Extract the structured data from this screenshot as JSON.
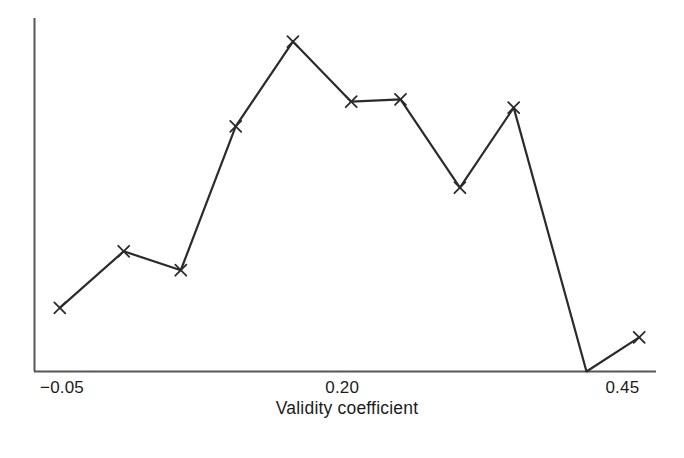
{
  "chart_data": {
    "type": "line",
    "title": "",
    "subtitle": "",
    "xlabel": "Validity coefficient",
    "ylabel": "",
    "grid": false,
    "legend": null,
    "marker": "x",
    "line_color": "#2b2b2b",
    "axis_color": "#555555",
    "background": "#ffffff",
    "xlim": [
      -0.075,
      0.48
    ],
    "ylim": [
      0,
      300
    ],
    "xticks": [
      {
        "value": -0.05,
        "label": "−0.05"
      },
      {
        "value": 0.2,
        "label": "0.20"
      },
      {
        "value": 0.45,
        "label": "0.45"
      }
    ],
    "yticks": [],
    "x": [
      -0.052,
      0.005,
      0.056,
      0.105,
      0.156,
      0.208,
      0.252,
      0.305,
      0.353,
      0.418,
      0.465
    ],
    "values": [
      54,
      102,
      86,
      208,
      280,
      229,
      231,
      156,
      224,
      0,
      29
    ],
    "series": [
      {
        "name": "frequency",
        "x": [
          -0.052,
          0.005,
          0.056,
          0.105,
          0.156,
          0.208,
          0.252,
          0.305,
          0.353,
          0.418,
          0.465
        ],
        "values": [
          54,
          102,
          86,
          208,
          280,
          229,
          231,
          156,
          224,
          0,
          29
        ]
      }
    ],
    "annotations": []
  },
  "axis_title": {
    "text": "Validity coefficient"
  },
  "tick_labels": {
    "t0": "−0.05",
    "t1": "0.20",
    "t2": "0.45"
  }
}
